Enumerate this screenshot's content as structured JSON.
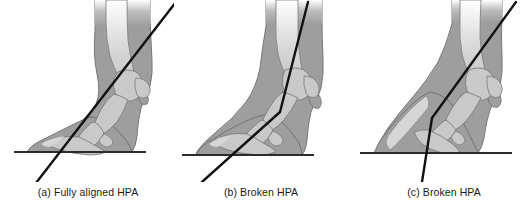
{
  "figure": {
    "background_color": "#ffffff",
    "colors": {
      "soft_tissue": "#9e9e9e",
      "bone": "#c9c9c9",
      "outline": "#6e6e6e",
      "axis_line": "#111111",
      "ground_line": "#2b2b2b",
      "caption_text": "#1a1a1a"
    },
    "panels": [
      {
        "id": "a",
        "caption": "(a) Fully aligned HPA",
        "label": "(a)",
        "condition": "Fully aligned HPA",
        "axis_type": "straight",
        "axis_line": {
          "points": "straight single line through pastern and hoof",
          "x1": 36,
          "y1": 183,
          "x2": 176,
          "y2": 2
        },
        "ground_line": {
          "x1": 14,
          "y1": 152,
          "x2": 146,
          "y2": 152
        }
      },
      {
        "id": "b",
        "caption": "(b) Broken HPA",
        "label": "(b)",
        "condition": "Broken HPA",
        "axis_type": "broken-back",
        "axis_line": {
          "points": "bent line, break at pastern joint",
          "x1": 28,
          "y1": 182,
          "bend_x": 106,
          "bend_y": 112,
          "x2": 134,
          "y2": 2
        },
        "ground_line": {
          "x1": 8,
          "y1": 155,
          "x2": 140,
          "y2": 155
        }
      },
      {
        "id": "c",
        "caption": "(c) Broken HPA",
        "label": "(c)",
        "condition": "Broken HPA",
        "axis_type": "broken-forward",
        "axis_line": {
          "points": "bent line, break at pastern joint",
          "x1": 74,
          "y1": 182,
          "bend_x": 84,
          "bend_y": 118,
          "x2": 168,
          "y2": 2
        },
        "ground_line": {
          "x1": 12,
          "y1": 153,
          "x2": 164,
          "y2": 153
        }
      }
    ]
  }
}
